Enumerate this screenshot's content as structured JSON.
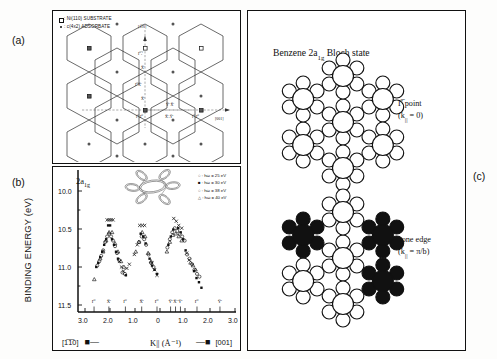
{
  "figure": {
    "panel_labels": {
      "a": "(a)",
      "b": "(b)",
      "c": "(c)"
    }
  },
  "panel_a": {
    "legend": [
      {
        "marker": "open-square",
        "text": ": Ni(110) SUBSTRATE"
      },
      {
        "marker": "filled-dot",
        "text": ": c(4x2) ADSORBATE"
      }
    ],
    "axis_direction_vertical": "[1̅1̅0]",
    "axis_direction_horizontal": "[001]",
    "zone_labels": [
      "Γ̅'ₓ̅'",
      "X̅'",
      "Γ̅'X̅'",
      "X̅'",
      "Γ̅'ₓΓ̅'",
      "Y̅' X̅'",
      "X̅'ₓY̅'",
      "Γ̅'ₓΓ̅'"
    ]
  },
  "panel_b": {
    "orbital_label": "2a1g",
    "ylabel": "BINDING ENERGY (eV)",
    "xlabel": "K|| (Å⁻¹)",
    "direction_left": "[1̅1̅0]",
    "direction_right": "[001]",
    "arrow_left": "←",
    "arrow_right": "←",
    "yticks": [
      "10.0",
      "10.5",
      "11.0",
      "11.5"
    ],
    "xticks": [
      "3.0",
      "2.0",
      "1.0",
      "0",
      "1.0",
      "2.0",
      "3.0"
    ],
    "symmetry_points": [
      "Γ̅'",
      "X̅'",
      "Γ̅'",
      "X̅'",
      "Γ̅'",
      "Y̅'",
      "X̅'",
      "Y̅'",
      "Γ̅'",
      "Y̅'"
    ],
    "legend": [
      {
        "marker": "open-circle",
        "text": ": ħω = 25 eV"
      },
      {
        "marker": "filled-square",
        "text": ": ħω = 30 eV"
      },
      {
        "marker": "open-circle2",
        "text": ": ħω = 38 eV"
      },
      {
        "marker": "open-triangle",
        "text": ": ħω = 40 eV"
      }
    ]
  },
  "panel_c": {
    "title": "Benzene 2a1g Bloch state",
    "top_label_line1": "Γ̅ point",
    "top_label_line2": "(k|| = 0)",
    "bottom_label_line1": "zone edge",
    "bottom_label_line2": "(k|| = π/b)"
  },
  "chart_data": {
    "type": "scatter",
    "xlabel": "K|| (Å⁻¹)",
    "ylabel": "BINDING ENERGY (eV)",
    "xlim": [
      -3.2,
      3.2
    ],
    "ylim": [
      11.75,
      9.7
    ],
    "y_axis_inverted": true,
    "xtick_values": [
      -3.0,
      -2.0,
      -1.0,
      0,
      1.0,
      2.0,
      3.0
    ],
    "xtick_labels": [
      "3.0",
      "2.0",
      "1.0",
      "0",
      "1.0",
      "2.0",
      "3.0"
    ],
    "ytick_values": [
      10.0,
      10.5,
      11.0,
      11.5
    ],
    "grid": false,
    "legend_position": "top-right",
    "symmetry_point_positions": [
      -2.55,
      -1.95,
      -1.28,
      -0.62,
      0.0,
      0.55,
      0.75,
      0.95,
      1.62,
      2.55
    ],
    "series": [
      {
        "name": "hω = 25 eV",
        "marker": "open-circle",
        "points": [
          [
            -2.42,
            11.08
          ],
          [
            -2.34,
            11.02
          ],
          [
            -2.26,
            10.94
          ],
          [
            -2.18,
            10.86
          ],
          [
            -2.1,
            10.74
          ],
          [
            -2.02,
            10.66
          ],
          [
            -1.94,
            10.62
          ],
          [
            -1.86,
            10.66
          ],
          [
            -1.78,
            10.72
          ],
          [
            -1.7,
            10.8
          ],
          [
            -1.62,
            10.9
          ],
          [
            -1.54,
            11.0
          ],
          [
            -1.4,
            11.18
          ],
          [
            -1.3,
            11.2
          ],
          [
            -0.72,
            10.74
          ],
          [
            -0.62,
            10.66
          ],
          [
            -0.52,
            10.7
          ],
          [
            -0.44,
            10.78
          ],
          [
            -0.34,
            10.92
          ],
          [
            -0.24,
            11.04
          ],
          [
            -0.14,
            11.1
          ],
          [
            0.42,
            10.82
          ],
          [
            0.52,
            10.7
          ],
          [
            0.62,
            10.6
          ],
          [
            0.72,
            10.54
          ],
          [
            0.82,
            10.58
          ],
          [
            0.92,
            10.62
          ],
          [
            1.02,
            10.66
          ],
          [
            1.12,
            10.72
          ],
          [
            1.22,
            10.92
          ],
          [
            1.32,
            10.98
          ],
          [
            1.42,
            11.06
          ],
          [
            1.52,
            11.14
          ],
          [
            1.62,
            11.2
          ],
          [
            1.72,
            11.24
          ]
        ]
      },
      {
        "name": "hω = 30 eV",
        "marker": "filled-square",
        "points": [
          [
            -2.46,
            11.1
          ],
          [
            -2.38,
            11.04
          ],
          [
            -2.3,
            10.96
          ],
          [
            -2.22,
            10.88
          ],
          [
            -2.14,
            10.78
          ],
          [
            -2.06,
            10.7
          ],
          [
            -1.98,
            10.5
          ],
          [
            -1.9,
            10.5
          ],
          [
            -1.82,
            10.7
          ],
          [
            -1.74,
            10.78
          ],
          [
            -1.66,
            10.88
          ],
          [
            -1.58,
            10.98
          ],
          [
            -1.26,
            11.22
          ],
          [
            -0.66,
            10.62
          ],
          [
            -0.56,
            10.66
          ],
          [
            -0.46,
            10.76
          ],
          [
            -0.3,
            10.98
          ],
          [
            -0.2,
            11.08
          ],
          [
            -0.1,
            11.14
          ],
          [
            0.0,
            11.2
          ],
          [
            0.46,
            10.78
          ],
          [
            0.56,
            10.66
          ],
          [
            0.66,
            10.56
          ],
          [
            0.86,
            10.54
          ],
          [
            0.96,
            10.6
          ],
          [
            1.06,
            10.7
          ],
          [
            1.16,
            10.86
          ],
          [
            1.5,
            11.16
          ],
          [
            1.6,
            11.26
          ],
          [
            1.7,
            11.32
          ],
          [
            1.8,
            11.4
          ]
        ]
      },
      {
        "name": "hω = 38 eV",
        "marker": "cross",
        "points": [
          [
            -2.02,
            10.42
          ],
          [
            -1.94,
            10.42
          ],
          [
            -1.86,
            10.42
          ],
          [
            -1.78,
            10.42
          ],
          [
            -1.52,
            11.02
          ],
          [
            -1.44,
            11.1
          ],
          [
            -1.36,
            11.16
          ],
          [
            -1.22,
            11.12
          ],
          [
            -1.12,
            11.06
          ],
          [
            -0.92,
            10.92
          ],
          [
            -0.8,
            10.78
          ],
          [
            -0.7,
            10.5
          ],
          [
            -0.6,
            10.5
          ],
          [
            -0.5,
            10.5
          ],
          [
            -0.2,
            11.04
          ],
          [
            -0.1,
            11.14
          ],
          [
            0.0,
            11.22
          ],
          [
            0.68,
            10.4
          ],
          [
            0.78,
            10.44
          ],
          [
            0.88,
            10.5
          ],
          [
            1.0,
            10.54
          ],
          [
            1.2,
            10.9
          ],
          [
            1.3,
            11.0
          ]
        ]
      },
      {
        "name": "hω = 40 eV",
        "marker": "open-triangle",
        "points": [
          [
            -2.54,
            11.28
          ],
          [
            -2.3,
            10.98
          ],
          [
            -2.18,
            10.88
          ],
          [
            -2.06,
            10.72
          ],
          [
            -1.94,
            10.6
          ],
          [
            -1.82,
            10.6
          ],
          [
            -1.7,
            10.76
          ],
          [
            -1.58,
            10.88
          ],
          [
            -1.46,
            11.02
          ],
          [
            -1.34,
            11.1
          ],
          [
            -0.86,
            10.88
          ],
          [
            -0.74,
            10.74
          ],
          [
            -0.6,
            10.6
          ],
          [
            -0.48,
            10.66
          ],
          [
            -0.36,
            10.9
          ],
          [
            -0.24,
            11.02
          ],
          [
            0.4,
            10.88
          ],
          [
            0.52,
            10.74
          ],
          [
            0.64,
            10.64
          ],
          [
            0.76,
            10.62
          ],
          [
            0.88,
            10.66
          ],
          [
            1.0,
            10.72
          ],
          [
            1.36,
            11.04
          ],
          [
            1.46,
            11.08
          ],
          [
            1.56,
            11.14
          ]
        ]
      }
    ]
  }
}
